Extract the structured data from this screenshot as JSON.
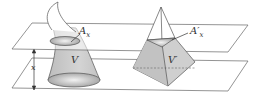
{
  "diagram": {
    "type": "cavalieri-principle-illustration",
    "labels": {
      "left_cross_section": "A",
      "left_cross_section_sub": "x",
      "right_cross_section": "A′",
      "right_cross_section_sub": "x",
      "left_volume": "V",
      "right_volume": "V′",
      "height_variable": "x"
    },
    "solids": [
      {
        "name": "curved solid",
        "volume_label": "V",
        "cross_section_label": "A_x"
      },
      {
        "name": "square pyramid",
        "volume_label": "V′",
        "cross_section_label": "A′_x"
      }
    ],
    "planes": [
      {
        "name": "upper plane"
      },
      {
        "name": "lower plane"
      }
    ],
    "colors": {
      "line": "#555555",
      "solid_fill": "#c9c9c9",
      "solid_fill_dark": "#a8a8a8",
      "ellipse_light": "#eeeeee",
      "background": "#ffffff"
    }
  }
}
